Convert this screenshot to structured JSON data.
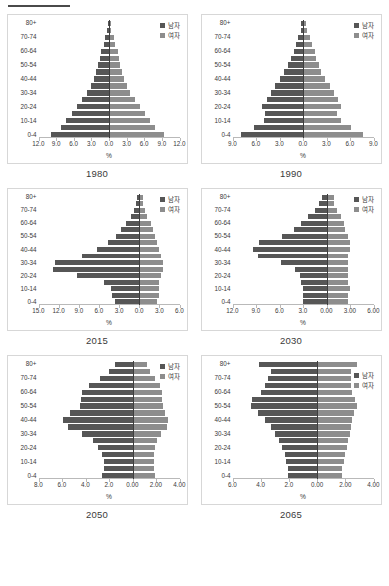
{
  "legend": {
    "male_label": "남자",
    "female_label": "여자",
    "male_color": "#565656",
    "female_color": "#8d8d8d"
  },
  "axis": {
    "x_title": "%",
    "age_groups": [
      "0-4",
      "5-9",
      "10-14",
      "15-19",
      "20-24",
      "25-29",
      "30-34",
      "35-39",
      "40-44",
      "45-49",
      "50-54",
      "55-59",
      "60-64",
      "65-69",
      "70-74",
      "75-79",
      "80+"
    ],
    "visible_age_labels": [
      "0-4",
      "10-14",
      "20-24",
      "30-34",
      "40-44",
      "50-54",
      "60-64",
      "70-74",
      "80+"
    ]
  },
  "chart_data": [
    {
      "type": "bar",
      "title": "1980",
      "xlabel": "%",
      "ylabel": "",
      "orientation": "population-pyramid",
      "legend_position": "top-right",
      "grid": false,
      "categories": [
        "0-4",
        "5-9",
        "10-14",
        "15-19",
        "20-24",
        "25-29",
        "30-34",
        "35-39",
        "40-44",
        "45-49",
        "50-54",
        "55-59",
        "60-64",
        "65-69",
        "70-74",
        "75-79",
        "80+"
      ],
      "xticks": [
        "12.0",
        "9.0",
        "6.0",
        "3.0",
        "0.0",
        "3.0",
        "6.0",
        "9.0",
        "12.0"
      ],
      "xlim_left": 12.0,
      "xlim_right": 12.0,
      "series": [
        {
          "name": "남자",
          "side": "left",
          "values": [
            9.9,
            8.2,
            7.4,
            6.3,
            5.4,
            4.6,
            3.7,
            3.1,
            2.6,
            2.2,
            1.9,
            1.6,
            1.3,
            0.9,
            0.6,
            0.3,
            0.2
          ]
        },
        {
          "name": "여자",
          "side": "right",
          "values": [
            9.4,
            7.8,
            7.0,
            6.1,
            5.3,
            4.5,
            3.6,
            3.0,
            2.5,
            2.2,
            1.9,
            1.7,
            1.5,
            1.1,
            0.8,
            0.4,
            0.3
          ]
        }
      ]
    },
    {
      "type": "bar",
      "title": "1990",
      "xlabel": "%",
      "ylabel": "",
      "orientation": "population-pyramid",
      "legend_position": "top-right",
      "grid": false,
      "categories": [
        "0-4",
        "5-9",
        "10-14",
        "15-19",
        "20-24",
        "25-29",
        "30-34",
        "35-39",
        "40-44",
        "45-49",
        "50-54",
        "55-59",
        "60-64",
        "65-69",
        "70-74",
        "75-79",
        "80+"
      ],
      "xticks": [
        "9.0",
        "6.0",
        "3.0",
        "0.0",
        "3.0",
        "6.0",
        "9.0"
      ],
      "xlim_left": 9.0,
      "xlim_right": 9.0,
      "series": [
        {
          "name": "남자",
          "side": "left",
          "values": [
            7.9,
            6.3,
            5.0,
            4.9,
            5.2,
            4.6,
            4.1,
            3.6,
            2.9,
            2.4,
            1.9,
            1.5,
            1.2,
            0.9,
            0.6,
            0.3,
            0.2
          ]
        },
        {
          "name": "여자",
          "side": "right",
          "values": [
            7.6,
            6.1,
            4.8,
            4.4,
            4.9,
            4.5,
            4.0,
            3.5,
            2.8,
            2.3,
            2.0,
            1.7,
            1.5,
            1.2,
            0.9,
            0.5,
            0.4
          ]
        }
      ]
    },
    {
      "type": "bar",
      "title": "2015",
      "xlabel": "%",
      "ylabel": "",
      "orientation": "population-pyramid",
      "legend_position": "top-right",
      "grid": false,
      "categories": [
        "0-4",
        "5-9",
        "10-14",
        "15-19",
        "20-24",
        "25-29",
        "30-34",
        "35-39",
        "40-44",
        "45-49",
        "50-54",
        "55-59",
        "60-64",
        "65-69",
        "70-74",
        "75-79",
        "80+"
      ],
      "xticks": [
        "15.0",
        "12.0",
        "9.0",
        "6.0",
        "3.0",
        "0.0",
        "3.0",
        "6.0"
      ],
      "xlim_left": 15.0,
      "xlim_right": 6.0,
      "series": [
        {
          "name": "남자",
          "side": "left",
          "values": [
            3.6,
            4.1,
            4.2,
            5.2,
            9.2,
            12.9,
            12.5,
            8.5,
            6.3,
            4.6,
            3.5,
            2.7,
            2.0,
            1.2,
            0.8,
            0.5,
            0.3
          ]
        },
        {
          "name": "여자",
          "side": "right",
          "values": [
            2.7,
            2.9,
            2.9,
            3.0,
            3.3,
            3.6,
            3.5,
            3.2,
            2.9,
            2.6,
            2.3,
            2.0,
            1.7,
            1.2,
            0.9,
            0.6,
            0.5
          ]
        }
      ]
    },
    {
      "type": "bar",
      "title": "2030",
      "xlabel": "%",
      "ylabel": "",
      "orientation": "population-pyramid",
      "legend_position": "top-right",
      "grid": false,
      "categories": [
        "0-4",
        "5-9",
        "10-14",
        "15-19",
        "20-24",
        "25-29",
        "30-34",
        "35-39",
        "40-44",
        "45-49",
        "50-54",
        "55-59",
        "60-64",
        "65-69",
        "70-74",
        "75-79",
        "80+"
      ],
      "xticks": [
        "12.0",
        "9.0",
        "6.0",
        "3.0",
        "0.00",
        "3.00",
        "6.00"
      ],
      "xlim_left": 12.0,
      "xlim_right": 6.0,
      "series": [
        {
          "name": "남자",
          "side": "left",
          "values": [
            3.0,
            3.0,
            3.0,
            3.2,
            3.4,
            4.0,
            5.8,
            8.8,
            9.4,
            8.6,
            5.7,
            4.2,
            3.3,
            2.4,
            1.5,
            0.9,
            0.6
          ]
        },
        {
          "name": "여자",
          "side": "right",
          "values": [
            2.7,
            2.8,
            3.0,
            2.8,
            2.8,
            2.8,
            2.8,
            2.8,
            3.0,
            3.0,
            2.7,
            2.4,
            2.2,
            1.9,
            1.4,
            1.0,
            0.9
          ]
        }
      ]
    },
    {
      "type": "bar",
      "title": "2050",
      "xlabel": "%",
      "ylabel": "",
      "orientation": "population-pyramid",
      "legend_position": "top-right",
      "grid": false,
      "categories": [
        "0-4",
        "5-9",
        "10-14",
        "15-19",
        "20-24",
        "25-29",
        "30-34",
        "35-39",
        "40-44",
        "45-49",
        "50-54",
        "55-59",
        "60-64",
        "65-69",
        "70-74",
        "75-79",
        "80+"
      ],
      "xticks": [
        "8.0",
        "6.0",
        "4.0",
        "2.0",
        "0.00",
        "2.00",
        "4.00"
      ],
      "xlim_left": 8.0,
      "xlim_right": 4.0,
      "series": [
        {
          "name": "남자",
          "side": "left",
          "values": [
            2.6,
            2.4,
            2.4,
            2.6,
            2.9,
            3.4,
            4.3,
            5.5,
            5.9,
            5.3,
            4.5,
            4.4,
            4.3,
            3.7,
            2.8,
            2.0,
            1.5
          ]
        },
        {
          "name": "여자",
          "side": "right",
          "values": [
            1.9,
            1.8,
            1.8,
            1.8,
            1.9,
            2.1,
            2.4,
            2.9,
            3.0,
            2.8,
            2.6,
            2.5,
            2.5,
            2.3,
            1.9,
            1.5,
            1.2
          ]
        }
      ]
    },
    {
      "type": "bar",
      "title": "2065",
      "xlabel": "%",
      "ylabel": "",
      "orientation": "population-pyramid",
      "legend_position": "middle-right",
      "grid": false,
      "categories": [
        "0-4",
        "5-9",
        "10-14",
        "15-19",
        "20-24",
        "25-29",
        "30-34",
        "35-39",
        "40-44",
        "45-49",
        "50-54",
        "55-59",
        "60-64",
        "65-69",
        "70-74",
        "75-79",
        "80+"
      ],
      "xticks": [
        "6.0",
        "4.0",
        "2.0",
        "0.00",
        "2.00",
        "4.00"
      ],
      "xlim_left": 6.0,
      "xlim_right": 4.0,
      "series": [
        {
          "name": "남자",
          "side": "left",
          "values": [
            2.1,
            2.1,
            2.2,
            2.3,
            2.5,
            2.7,
            3.0,
            3.3,
            3.7,
            4.2,
            4.7,
            4.6,
            4.0,
            3.7,
            3.5,
            3.3,
            4.1
          ]
        },
        {
          "name": "여자",
          "side": "right",
          "values": [
            1.8,
            1.8,
            1.9,
            2.0,
            2.1,
            2.2,
            2.3,
            2.4,
            2.5,
            2.6,
            2.8,
            2.7,
            2.5,
            2.4,
            2.4,
            2.4,
            2.8
          ]
        }
      ]
    }
  ]
}
